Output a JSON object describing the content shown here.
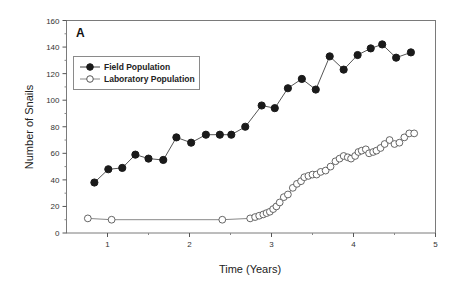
{
  "chart_data": {
    "type": "line",
    "panel_label": "A",
    "title": "",
    "xlabel": "Time (Years)",
    "ylabel": "Number of Snails",
    "xlim": [
      0.5,
      5
    ],
    "ylim": [
      0,
      160
    ],
    "xticks": [
      1,
      2,
      3,
      4,
      5
    ],
    "yticks": [
      0,
      20,
      40,
      60,
      80,
      100,
      120,
      140,
      160
    ],
    "grid": false,
    "legend_position": "upper-left",
    "series": [
      {
        "name": "Field Population",
        "marker": "filled-circle",
        "color": "#1a1a1a",
        "x": [
          0.84,
          1.01,
          1.18,
          1.34,
          1.5,
          1.68,
          1.84,
          2.02,
          2.2,
          2.37,
          2.51,
          2.68,
          2.88,
          3.04,
          3.2,
          3.37,
          3.54,
          3.71,
          3.88,
          4.05,
          4.21,
          4.35,
          4.52,
          4.7
        ],
        "y": [
          38,
          48,
          49,
          59,
          56,
          55,
          72,
          68,
          74,
          74,
          74,
          80,
          96,
          94,
          109,
          116,
          108,
          133,
          123,
          134,
          139,
          142,
          132,
          136
        ]
      },
      {
        "name": "Laboratory Population",
        "marker": "open-circle",
        "color": "#1a1a1a",
        "x": [
          0.76,
          1.05,
          2.4,
          2.74,
          2.8,
          2.85,
          2.9,
          2.94,
          2.98,
          3.02,
          3.06,
          3.1,
          3.15,
          3.2,
          3.26,
          3.31,
          3.36,
          3.4,
          3.45,
          3.5,
          3.55,
          3.6,
          3.66,
          3.72,
          3.78,
          3.83,
          3.88,
          3.93,
          3.97,
          4.02,
          4.06,
          4.1,
          4.15,
          4.19,
          4.24,
          4.28,
          4.33,
          4.38,
          4.44,
          4.5,
          4.56,
          4.62,
          4.68,
          4.74
        ],
        "y": [
          11,
          10,
          10,
          11,
          12,
          13,
          14,
          15,
          16,
          18,
          20,
          23,
          27,
          29,
          34,
          37,
          39,
          42,
          43,
          44,
          44,
          46,
          47,
          50,
          54,
          56,
          58,
          57,
          56,
          58,
          61,
          62,
          63,
          60,
          61,
          62,
          64,
          67,
          70,
          67,
          68,
          72,
          75,
          75
        ]
      }
    ]
  }
}
